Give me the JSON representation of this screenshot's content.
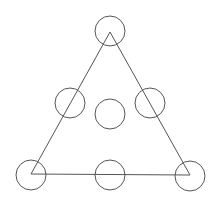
{
  "diagram": {
    "width": 223,
    "height": 214,
    "background": "#ffffff",
    "stroke_color": "#555555",
    "triangle": {
      "points": [
        [
          110,
          32
        ],
        [
          31,
          174
        ],
        [
          190,
          175
        ]
      ]
    },
    "circle_radius": 15,
    "circles": [
      {
        "id": "top",
        "cx": 110,
        "cy": 31
      },
      {
        "id": "mid-left",
        "cx": 70,
        "cy": 103
      },
      {
        "id": "mid-right",
        "cx": 150,
        "cy": 103
      },
      {
        "id": "center",
        "cx": 110,
        "cy": 114
      },
      {
        "id": "bottom-left",
        "cx": 31,
        "cy": 175
      },
      {
        "id": "bottom-middle",
        "cx": 110,
        "cy": 175
      },
      {
        "id": "bottom-right",
        "cx": 190,
        "cy": 176
      }
    ]
  }
}
